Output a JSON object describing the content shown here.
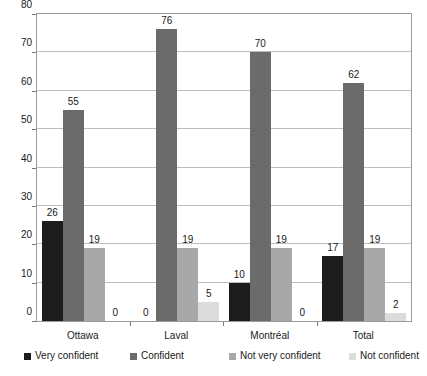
{
  "chart_data": {
    "type": "bar",
    "title": "",
    "subtitle": "",
    "xlabel": "",
    "ylabel": "",
    "categories": [
      "Ottawa",
      "Laval",
      "Montréal",
      "Total"
    ],
    "series": [
      {
        "name": "Very confident",
        "color": "#1c1c1c",
        "values": [
          26,
          0,
          10,
          17
        ]
      },
      {
        "name": "Confident",
        "color": "#6b6b6b",
        "values": [
          55,
          76,
          70,
          62
        ]
      },
      {
        "name": "Not very confident",
        "color": "#a8a8a8",
        "values": [
          19,
          19,
          19,
          19
        ]
      },
      {
        "name": "Not confident",
        "color": "#dcdcdc",
        "values": [
          0,
          5,
          0,
          2
        ]
      }
    ],
    "ylim": [
      0,
      80
    ],
    "yticks": [
      0,
      10,
      20,
      30,
      40,
      50,
      60,
      70,
      80
    ],
    "ytick_labels": [
      "0",
      "10",
      "20",
      "30",
      "40",
      "50",
      "60",
      "70",
      "80"
    ],
    "grid": true,
    "grid_axis": "y",
    "legend_position": "bottom",
    "show_value_labels": true,
    "value_labels": {
      "Ottawa": [
        "26",
        "55",
        "19",
        "0"
      ],
      "Laval": [
        "0",
        "76",
        "19",
        "5"
      ],
      "Montréal": [
        "10",
        "70",
        "19",
        "0"
      ],
      "Total": [
        "17",
        "62",
        "19",
        "2"
      ]
    },
    "colors": {
      "plot_border": "#9a9a9a",
      "gridline": "#bdbdbd",
      "background": "#ffffff",
      "text": "#1a1a1a"
    }
  }
}
